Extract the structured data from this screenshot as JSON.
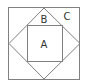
{
  "diagram": {
    "labels": {
      "A": "A",
      "B": "B",
      "C": "C"
    },
    "colors": {
      "stroke": "#808080",
      "label": "#333333",
      "background": "#ffffff"
    }
  }
}
